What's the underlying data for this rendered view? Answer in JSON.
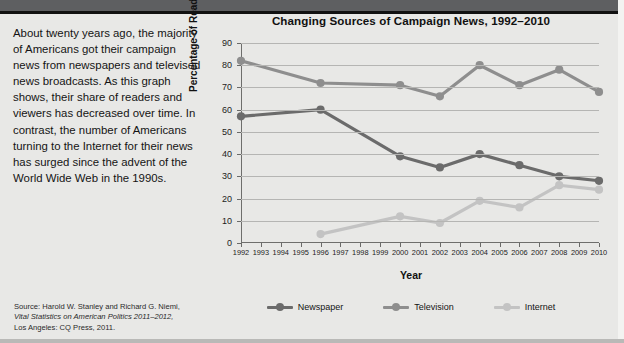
{
  "topbar": {
    "label": ""
  },
  "prose": {
    "body": "About twenty years ago, the majority of Americans got their campaign news from newspapers and televised news broadcasts. As this graph shows, their share of readers and viewers has decreased over time. In contrast, the number of Americans turning to the Internet for their news has surged since the advent of the World Wide Web in the 1990s."
  },
  "source": {
    "line1": "Source: Harold W. Stanley and Richard G. Niemi,",
    "line2": "Vital Statistics on American Politics 2011–2012,",
    "line3": "Los Angeles: CQ Press, 2011."
  },
  "colors": {
    "newspaper": "#6b6b6b",
    "television": "#8e8e8e",
    "internet": "#c3c3c3",
    "grid": "#b5b5b3",
    "axis": "#6e6e6c",
    "background": "#e8e8e6",
    "topbar": "#5e5f61"
  },
  "chart_data": {
    "type": "line",
    "title": "Changing Sources of Campaign News, 1992–2010",
    "xlabel": "Year",
    "ylabel": "Percentage of Readers/Viewers",
    "ylim": [
      0,
      90
    ],
    "yticks": [
      0,
      10,
      20,
      30,
      40,
      50,
      60,
      70,
      80,
      90
    ],
    "grid": true,
    "legend_position": "bottom",
    "categories": [
      "1992",
      "1993",
      "1994",
      "1995",
      "1996",
      "1997",
      "1998",
      "1999",
      "2000",
      "2001",
      "2002",
      "2003",
      "2004",
      "2005",
      "2006",
      "2007",
      "2008",
      "2009",
      "2010"
    ],
    "xlim": [
      1992,
      2010
    ],
    "series": [
      {
        "name": "Newspaper",
        "color": "#6b6b6b",
        "x": [
          1992,
          1996,
          2000,
          2002,
          2004,
          2006,
          2008,
          2010
        ],
        "values": [
          57,
          60,
          39,
          34,
          40,
          35,
          30,
          28
        ]
      },
      {
        "name": "Television",
        "color": "#8e8e8e",
        "x": [
          1992,
          1996,
          2000,
          2002,
          2004,
          2006,
          2008,
          2010
        ],
        "values": [
          82,
          72,
          71,
          66,
          80,
          71,
          78,
          68
        ]
      },
      {
        "name": "Internet",
        "color": "#c3c3c3",
        "x": [
          1996,
          2000,
          2002,
          2004,
          2006,
          2008,
          2010
        ],
        "values": [
          4,
          12,
          9,
          19,
          16,
          26,
          24
        ]
      }
    ]
  }
}
